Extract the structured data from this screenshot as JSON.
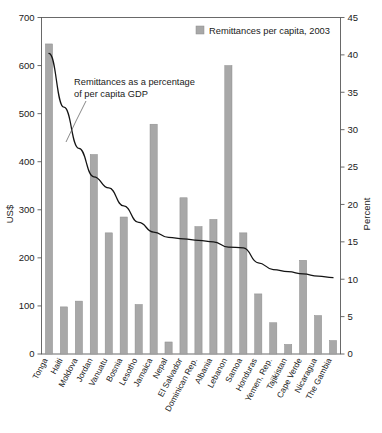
{
  "chart_data": {
    "type": "bar",
    "title": "",
    "subtitle": "",
    "categories": [
      "Tonga",
      "Haiti",
      "Moldova",
      "Jordan",
      "Vanuatu",
      "Bosnia",
      "Lesotho",
      "Jamaica",
      "Nepal",
      "El Salvador",
      "Dominican Rep.",
      "Albania",
      "Lebanon",
      "Samoa",
      "Honduras",
      "Yemen, Rep.",
      "Tajikistan",
      "Cape Verde",
      "Nicaragua",
      "The Gambia"
    ],
    "series": [
      {
        "name": "Remittances per capita, 2003",
        "type": "bar",
        "axis": "left",
        "unit": "US$",
        "values": [
          645,
          98,
          110,
          415,
          252,
          285,
          103,
          478,
          25,
          325,
          265,
          280,
          600,
          252,
          125,
          65,
          20,
          195,
          80,
          28
        ]
      },
      {
        "name": "Remittances as a percentage of per capita GDP",
        "type": "line",
        "axis": "right",
        "unit": "Percent",
        "values": [
          40.2,
          33.0,
          27.5,
          23.7,
          22.2,
          19.8,
          17.6,
          16.3,
          15.6,
          15.4,
          15.2,
          15.0,
          14.3,
          14.2,
          12.2,
          11.3,
          11.0,
          10.7,
          10.4,
          10.2
        ]
      }
    ],
    "xlabel": "",
    "ylabel": "US$",
    "ylabel_right": "Percent",
    "ylim": [
      0,
      700
    ],
    "ylim_right": [
      0,
      45
    ],
    "yticks": [
      0,
      100,
      200,
      300,
      400,
      500,
      600,
      700
    ],
    "yticks_right": [
      0,
      5,
      10,
      15,
      20,
      25,
      30,
      35,
      40,
      45
    ],
    "grid": false,
    "legend_position": "top-right",
    "legend": [
      "Remittances per capita, 2003"
    ],
    "annotations": [
      {
        "text_line1": "Remittances as a percentage",
        "text_line2": "of per capita GDP"
      }
    ],
    "colors": {
      "bar": "#a8a8a8",
      "line": "#141414",
      "axis": "#5a5a5a",
      "background": "#ffffff"
    }
  },
  "axes": {
    "left_title": "US$",
    "right_title": "Percent",
    "left_ticks": [
      "700",
      "600",
      "500",
      "400",
      "300",
      "200",
      "100",
      "0"
    ],
    "right_ticks": [
      "45",
      "40",
      "35",
      "30",
      "25",
      "20",
      "15",
      "10",
      "5",
      "0"
    ]
  },
  "legend": {
    "entry_1": "Remittances per capita, 2003"
  },
  "annotation": {
    "line1": "Remittances as a percentage",
    "line2": "of per capita GDP"
  },
  "categories": {
    "c0": "Tonga",
    "c1": "Haiti",
    "c2": "Moldova",
    "c3": "Jordan",
    "c4": "Vanuatu",
    "c5": "Bosnia",
    "c6": "Lesotho",
    "c7": "Jamaica",
    "c8": "Nepal",
    "c9": "El Salvador",
    "c10": "Dominican Rep.",
    "c11": "Albania",
    "c12": "Lebanon",
    "c13": "Samoa",
    "c14": "Honduras",
    "c15": "Yemen, Rep.",
    "c16": "Tajikistan",
    "c17": "Cape Verde",
    "c18": "Nicaragua",
    "c19": "The Gambia"
  }
}
